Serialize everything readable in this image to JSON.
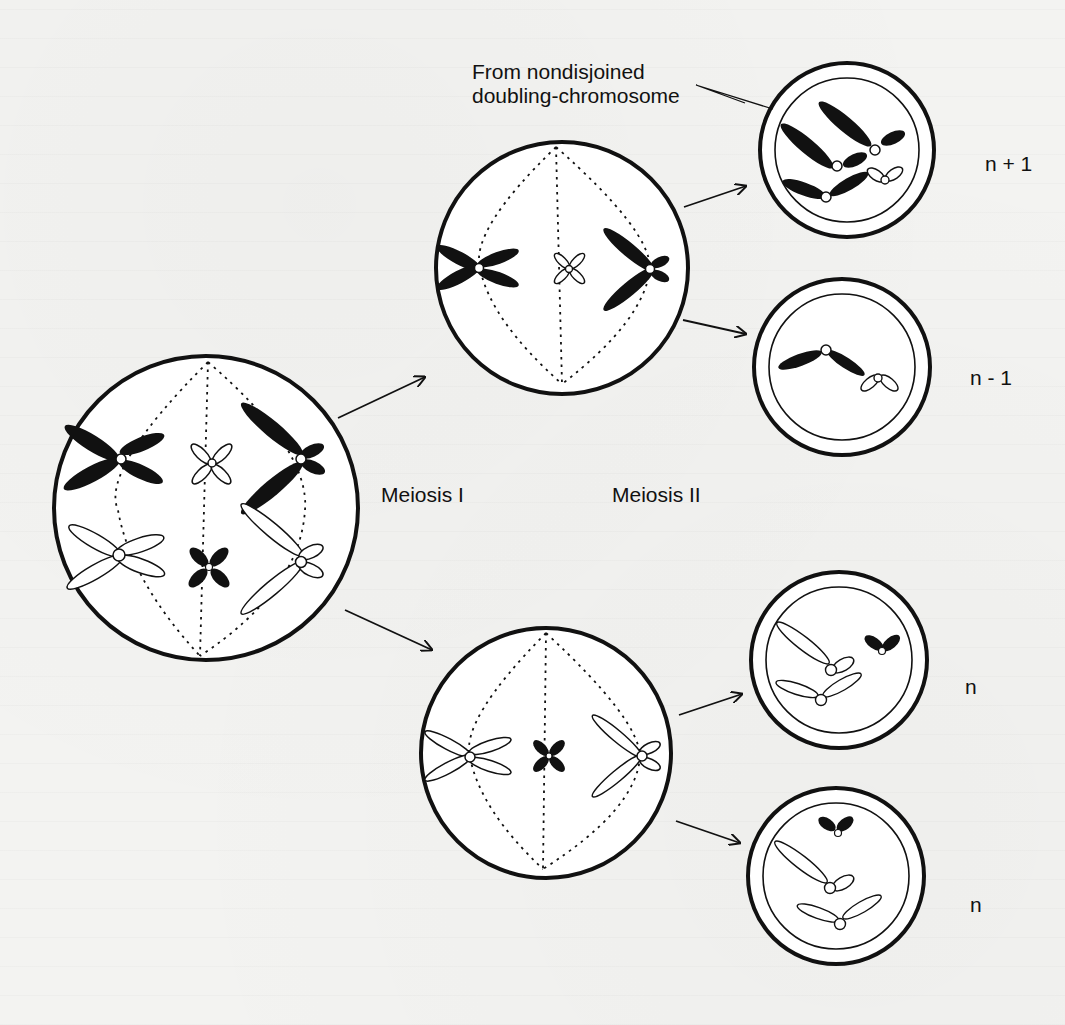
{
  "figure": {
    "background_color": "#f3f3f1",
    "ink_color": "#111111"
  },
  "labels": {
    "annotation_line1": "From nondisjoined",
    "annotation_line2": "doubling-chromosome",
    "meiosis_1": "Meiosis I",
    "meiosis_2": "Meiosis II",
    "gamete_1": "n + 1",
    "gamete_2": "n - 1",
    "gamete_3": "n",
    "gamete_4": "n"
  },
  "cells": [
    {
      "id": "parent-cell",
      "stage": "Metaphase I",
      "chromosomes": 6
    },
    {
      "id": "upper-daughter",
      "stage": "Metaphase II",
      "chromosomes": 3
    },
    {
      "id": "lower-daughter",
      "stage": "Metaphase II",
      "chromosomes": 3
    },
    {
      "id": "gamete-n-plus-1",
      "ploidy": "n + 1"
    },
    {
      "id": "gamete-n-minus-1",
      "ploidy": "n - 1"
    },
    {
      "id": "gamete-n-a",
      "ploidy": "n"
    },
    {
      "id": "gamete-n-b",
      "ploidy": "n"
    }
  ]
}
